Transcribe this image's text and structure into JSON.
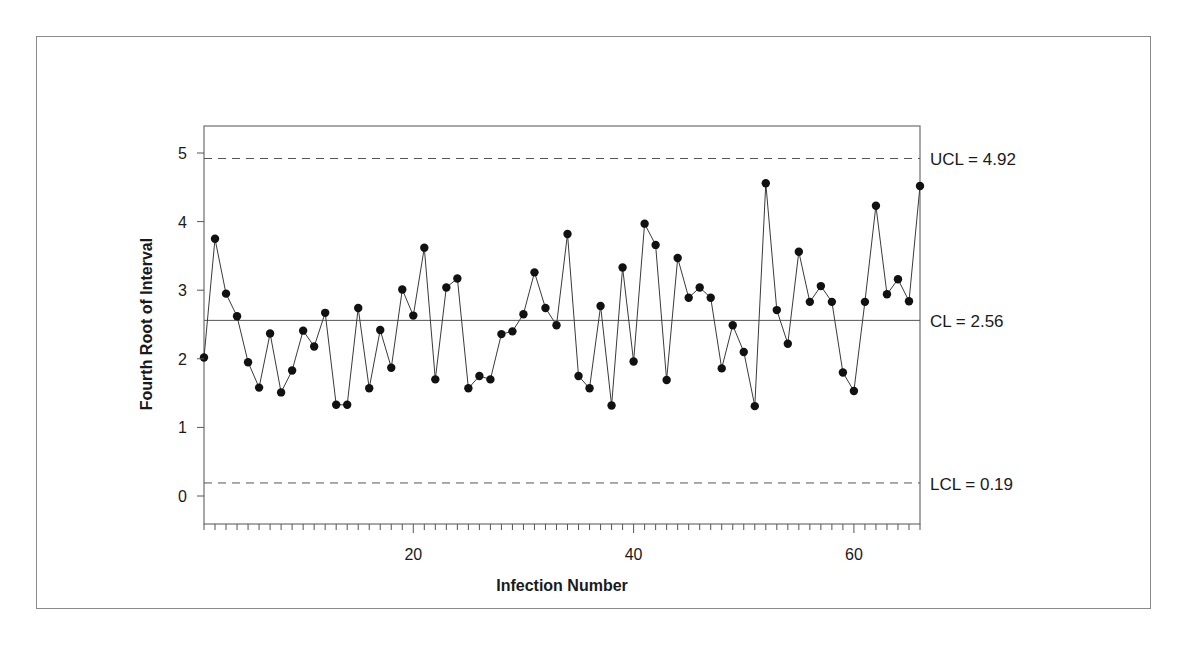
{
  "chart_data": {
    "type": "line",
    "title": "",
    "xlabel": "Infection Number",
    "ylabel": "Fourth Root of Interval",
    "xlim": [
      1,
      66
    ],
    "ylim": [
      -0.35,
      5.4
    ],
    "x_ticks": [
      20,
      40,
      60
    ],
    "y_ticks": [
      0,
      1,
      2,
      3,
      4,
      5
    ],
    "grid": false,
    "legend": null,
    "control_limits": {
      "ucl": {
        "value": 4.92,
        "label": "UCL = 4.92",
        "style": "dashed"
      },
      "cl": {
        "value": 2.56,
        "label": "CL = 2.56",
        "style": "solid"
      },
      "lcl": {
        "value": 0.19,
        "label": "LCL = 0.19",
        "style": "dashed"
      }
    },
    "x": [
      1,
      2,
      3,
      4,
      5,
      6,
      7,
      8,
      9,
      10,
      11,
      12,
      13,
      14,
      15,
      16,
      17,
      18,
      19,
      20,
      21,
      22,
      23,
      24,
      25,
      26,
      27,
      28,
      29,
      30,
      31,
      32,
      33,
      34,
      35,
      36,
      37,
      38,
      39,
      40,
      41,
      42,
      43,
      44,
      45,
      46,
      47,
      48,
      49,
      50,
      51,
      52,
      53,
      54,
      55,
      56,
      57,
      58,
      59,
      60,
      61,
      62,
      63,
      64,
      65,
      66
    ],
    "series": [
      {
        "name": "Fourth Root of Interval",
        "values": [
          2.02,
          3.75,
          2.95,
          2.62,
          1.95,
          1.58,
          2.37,
          1.51,
          1.83,
          2.41,
          2.18,
          2.67,
          1.33,
          1.33,
          2.74,
          1.57,
          2.42,
          1.87,
          3.01,
          2.63,
          3.62,
          1.7,
          3.04,
          3.17,
          1.57,
          1.75,
          1.7,
          2.36,
          2.4,
          2.65,
          3.26,
          2.74,
          2.49,
          3.82,
          1.75,
          1.57,
          2.77,
          1.32,
          3.33,
          1.96,
          3.97,
          3.66,
          1.69,
          3.47,
          2.89,
          3.04,
          2.89,
          1.86,
          2.49,
          2.1,
          1.31,
          4.56,
          2.71,
          2.22,
          3.56,
          2.83,
          3.06,
          2.83,
          1.8,
          1.53,
          2.83,
          4.23,
          2.94,
          3.16,
          2.84,
          4.52
        ]
      }
    ]
  }
}
